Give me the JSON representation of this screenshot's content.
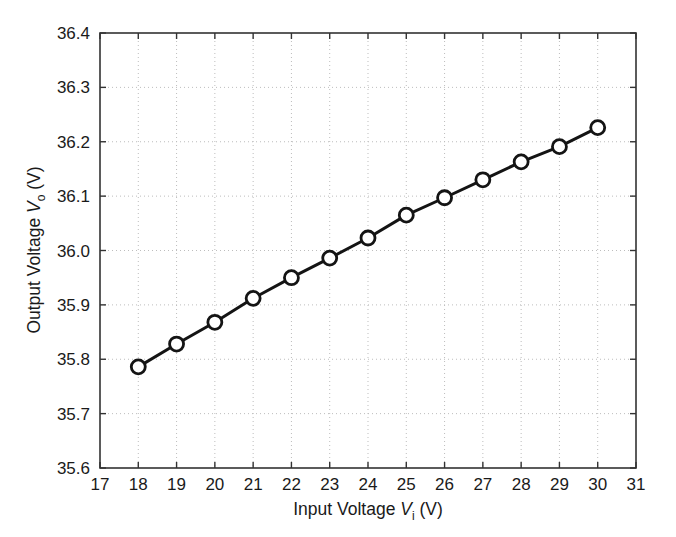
{
  "chart_data": {
    "type": "line",
    "title": "",
    "xlabel": "Input Voltage V_i (V)",
    "ylabel": "Output Voltage V_o (V)",
    "xlabel_parts": {
      "pre": "Input Voltage ",
      "var": "V",
      "sub": "i",
      "post": " (V)"
    },
    "ylabel_parts": {
      "pre": "Output Voltage ",
      "var": "V",
      "sub": "o",
      "post": " (V)"
    },
    "xlim": [
      17,
      31
    ],
    "ylim": [
      35.6,
      36.4
    ],
    "xticks": [
      17,
      18,
      19,
      20,
      21,
      22,
      23,
      24,
      25,
      26,
      27,
      28,
      29,
      30,
      31
    ],
    "yticks": [
      35.6,
      35.7,
      35.8,
      35.9,
      36.0,
      36.1,
      36.2,
      36.3,
      36.4
    ],
    "xtick_labels": [
      "17",
      "18",
      "19",
      "20",
      "21",
      "22",
      "23",
      "24",
      "25",
      "26",
      "27",
      "28",
      "29",
      "30",
      "31"
    ],
    "ytick_labels": [
      "35.6",
      "35.7",
      "35.8",
      "35.9",
      "36.0",
      "36.1",
      "36.2",
      "36.3",
      "36.4"
    ],
    "grid": true,
    "grid_style": "dotted",
    "grid_color": "#bdbdbd",
    "legend": null,
    "marker": "open-circle",
    "line_color": "#141414",
    "line_width": 3,
    "x": [
      18,
      19,
      20,
      21,
      22,
      23,
      24,
      25,
      26,
      27,
      28,
      29,
      30
    ],
    "values": [
      35.786,
      35.828,
      35.868,
      35.912,
      35.95,
      35.986,
      36.023,
      36.065,
      36.097,
      36.13,
      36.163,
      36.191,
      36.226
    ],
    "series": [
      {
        "name": "Output Voltage",
        "x": [
          18,
          19,
          20,
          21,
          22,
          23,
          24,
          25,
          26,
          27,
          28,
          29,
          30
        ],
        "values": [
          35.786,
          35.828,
          35.868,
          35.912,
          35.95,
          35.986,
          36.023,
          36.065,
          36.097,
          36.13,
          36.163,
          36.191,
          36.226
        ]
      }
    ]
  },
  "colors": {
    "axis": "#333333",
    "line": "#141414",
    "grid": "#bdbdbd",
    "background": "#ffffff",
    "text": "#1a1a1a"
  }
}
